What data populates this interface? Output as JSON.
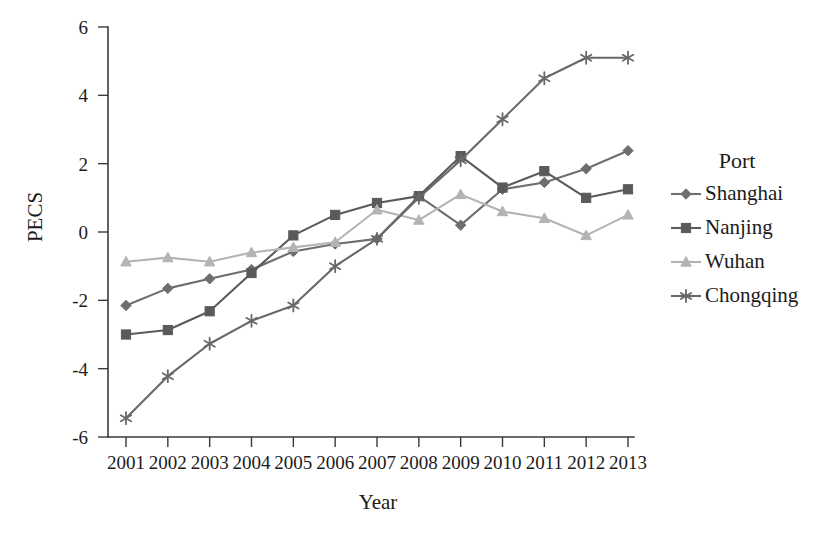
{
  "chart_data": {
    "type": "line",
    "title": "",
    "xlabel": "Year",
    "ylabel": "PECS",
    "categories": [
      "2001",
      "2002",
      "2003",
      "2004",
      "2005",
      "2006",
      "2007",
      "2008",
      "2009",
      "2010",
      "2011",
      "2012",
      "2013"
    ],
    "x": [
      2001,
      2002,
      2003,
      2004,
      2005,
      2006,
      2007,
      2008,
      2009,
      2010,
      2011,
      2012,
      2013
    ],
    "xlim": [
      2001,
      2013
    ],
    "ylim": [
      -6,
      6
    ],
    "y_ticks": [
      -6,
      -4,
      -2,
      0,
      2,
      4,
      6
    ],
    "y_tick_labels": [
      "-6",
      "-4",
      "-2",
      "0",
      "2",
      "4",
      "6"
    ],
    "grid": false,
    "legend_position": "right",
    "legend_title": "Port",
    "series": [
      {
        "name": "Shanghai",
        "marker": "diamond",
        "color": "#6e6e6e",
        "values": [
          -2.15,
          -1.65,
          -1.37,
          -1.1,
          -0.57,
          -0.35,
          -0.2,
          1.05,
          0.2,
          1.25,
          1.45,
          1.85,
          2.38
        ]
      },
      {
        "name": "Nanjing",
        "marker": "square",
        "color": "#5a5a5a",
        "values": [
          -3.0,
          -2.87,
          -2.32,
          -1.2,
          -0.1,
          0.5,
          0.85,
          1.05,
          2.22,
          1.3,
          1.78,
          1.0,
          1.25
        ]
      },
      {
        "name": "Wuhan",
        "marker": "triangle",
        "color": "#b4b4b4",
        "values": [
          -0.87,
          -0.75,
          -0.87,
          -0.6,
          -0.45,
          -0.3,
          0.65,
          0.35,
          1.1,
          0.6,
          0.4,
          -0.1,
          0.5
        ]
      },
      {
        "name": "Chongqing",
        "marker": "asterisk",
        "color": "#686868",
        "values": [
          -5.45,
          -4.22,
          -3.27,
          -2.6,
          -2.15,
          -1.0,
          -0.2,
          1.0,
          2.1,
          3.3,
          4.5,
          5.1,
          5.1
        ]
      }
    ]
  },
  "axes": {
    "y_label": "PECS",
    "x_label": "Year"
  },
  "legend": {
    "title": "Port",
    "items": [
      {
        "label": "Shanghai"
      },
      {
        "label": "Nanjing"
      },
      {
        "label": "Wuhan"
      },
      {
        "label": "Chongqing"
      }
    ]
  }
}
